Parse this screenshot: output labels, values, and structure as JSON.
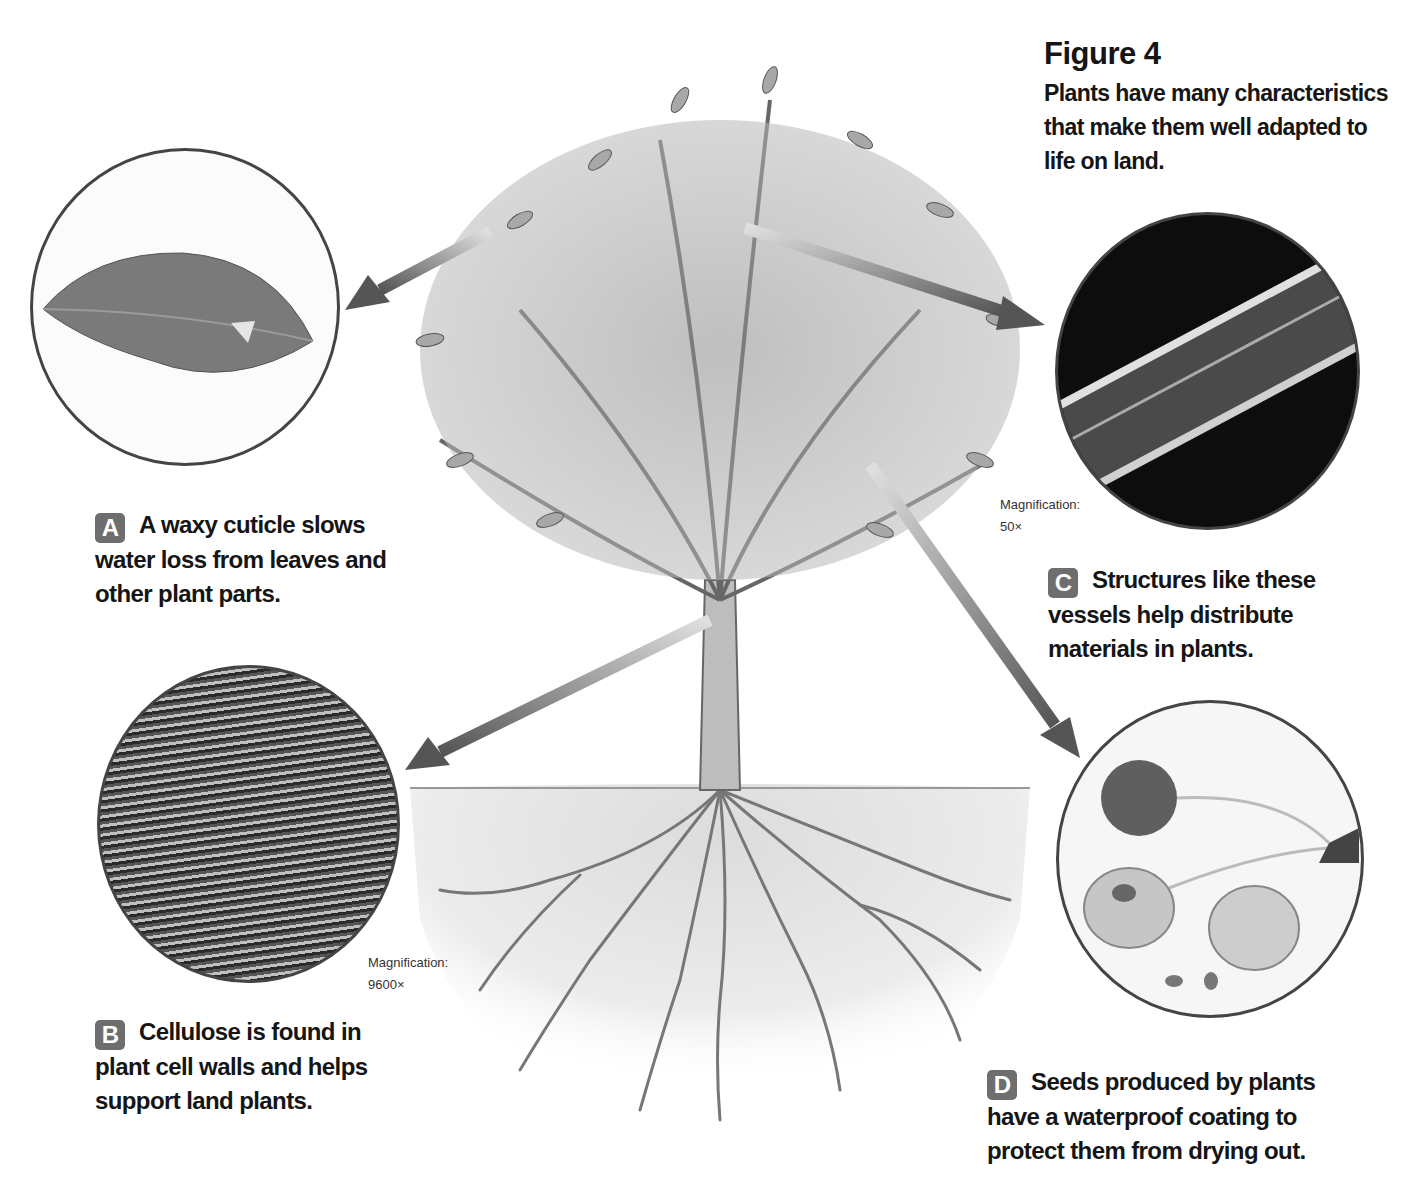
{
  "figure": {
    "title": "Figure 4",
    "caption": "Plants have many characteristics that make them well adapted to life on land."
  },
  "callouts": [
    {
      "badge": "A",
      "text": "A waxy cuticle slows water loss from leaves and other plant parts.",
      "image": "leaf-photo",
      "magnification": null
    },
    {
      "badge": "B",
      "text": "Cellulose is found in plant cell walls and helps support land plants.",
      "image": "cellulose-micrograph",
      "magnification": {
        "label": "Magnification:",
        "value": "9600×"
      }
    },
    {
      "badge": "C",
      "text": "Structures like these vessels help distribute materials in plants.",
      "image": "vessel-micrograph",
      "magnification": {
        "label": "Magnification:",
        "value": "50×"
      }
    },
    {
      "badge": "D",
      "text": "Seeds produced by plants have a waterproof coating to protect them from drying out.",
      "image": "cherry-seeds-photo",
      "magnification": null
    }
  ],
  "colors": {
    "badge": "#6e6e6e",
    "arrow_dark": "#555555",
    "arrow_light": "#d8d8d8",
    "circle_border": "#444444"
  }
}
